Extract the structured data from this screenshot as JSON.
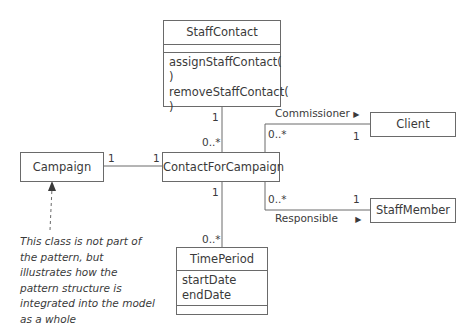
{
  "classes": {
    "staff_contact": {
      "name": "StaffContact",
      "attributes": [],
      "operations": [
        "assignStaffContact( )",
        "removeStaffContact( )"
      ]
    },
    "contact_for_campaign": {
      "name": "ContactForCampaign"
    },
    "campaign": {
      "name": "Campaign"
    },
    "client": {
      "name": "Client"
    },
    "staff_member": {
      "name": "StaffMember"
    },
    "time_period": {
      "name": "TimePeriod",
      "attributes": [
        "startDate",
        "endDate"
      ],
      "operations": []
    }
  },
  "associations": {
    "staff_contact_to_cfc": {
      "end_staff_contact": "1",
      "end_cfc": "0..*"
    },
    "campaign_to_cfc": {
      "end_campaign": "1",
      "end_cfc": "1"
    },
    "commissioner": {
      "name": "Commissioner",
      "direction_arrow": "▶",
      "end_cfc": "0..*",
      "end_client": "1"
    },
    "responsible": {
      "name": "Responsible",
      "direction_arrow": "▶",
      "end_cfc": "0..*",
      "end_staff_member": "1"
    },
    "cfc_to_time_period": {
      "end_cfc": "1",
      "end_time_period": "0..*"
    }
  },
  "note": {
    "text": "This class is not part of the pattern, but illustrates how the pattern structure is integrated into the model as a whole"
  },
  "colors": {
    "line": "#6a6a6a",
    "text": "#3a3a3a"
  }
}
